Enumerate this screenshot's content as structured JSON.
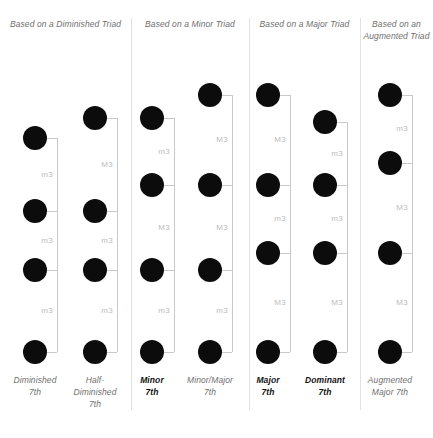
{
  "figure": {
    "dot_color": "#0c0c0c",
    "line_color": "#c9c9c9",
    "divider_color": "#e2e2e2",
    "label_color": "#bcbcbc",
    "text_color": "#6f6f6f"
  },
  "groups": [
    {
      "id": "diminished",
      "heading": "Based on a Diminished Triad",
      "left": 0,
      "width": 131
    },
    {
      "id": "minor",
      "heading": "Based on a Minor Triad",
      "left": 131,
      "width": 118
    },
    {
      "id": "major",
      "heading": "Based on a Major Triad",
      "left": 249,
      "width": 111
    },
    {
      "id": "augmented",
      "heading": "Based on an Augmented Triad",
      "left": 360,
      "width": 73
    }
  ],
  "dividers": [
    131,
    249,
    360
  ],
  "chart_data": {
    "type": "diagram",
    "interval_legend": {
      "m3": "minor third",
      "M3": "major third"
    },
    "columns": [
      {
        "name_lines": [
          "Diminished",
          "7th"
        ],
        "emphasis": false,
        "group": "diminished",
        "center_x": 35,
        "intervals_bottom_up": [
          "m3",
          "m3",
          "m3"
        ],
        "dot_y_top_down": [
          138,
          211,
          270,
          352
        ]
      },
      {
        "name_lines": [
          "Half-",
          "Diminished",
          "7th"
        ],
        "emphasis": false,
        "group": "diminished",
        "center_x": 95,
        "intervals_bottom_up": [
          "m3",
          "m3",
          "M3"
        ],
        "dot_y_top_down": [
          118,
          211,
          270,
          352
        ]
      },
      {
        "name_lines": [
          "Minor",
          "7th"
        ],
        "emphasis": true,
        "group": "minor",
        "center_x": 152,
        "intervals_bottom_up": [
          "m3",
          "M3",
          "m3"
        ],
        "dot_y_top_down": [
          118,
          185,
          270,
          352
        ]
      },
      {
        "name_lines": [
          "Minor/Major",
          "7th"
        ],
        "emphasis": false,
        "group": "minor",
        "center_x": 210,
        "intervals_bottom_up": [
          "m3",
          "M3",
          "M3"
        ],
        "dot_y_top_down": [
          95,
          185,
          270,
          352
        ]
      },
      {
        "name_lines": [
          "Major",
          "7th"
        ],
        "emphasis": true,
        "group": "major",
        "center_x": 268,
        "intervals_bottom_up": [
          "M3",
          "m3",
          "M3"
        ],
        "dot_y_top_down": [
          95,
          185,
          253,
          352
        ]
      },
      {
        "name_lines": [
          "Dominant",
          "7th"
        ],
        "emphasis": true,
        "group": "major",
        "center_x": 325,
        "intervals_bottom_up": [
          "M3",
          "m3",
          "m3"
        ],
        "dot_y_top_down": [
          122,
          185,
          253,
          352
        ]
      },
      {
        "name_lines": [
          "Augmented",
          "Major 7th"
        ],
        "emphasis": false,
        "group": "augmented",
        "center_x": 390,
        "intervals_bottom_up": [
          "M3",
          "M3",
          "m3"
        ],
        "dot_y_top_down": [
          95,
          163,
          253,
          352
        ]
      }
    ]
  }
}
